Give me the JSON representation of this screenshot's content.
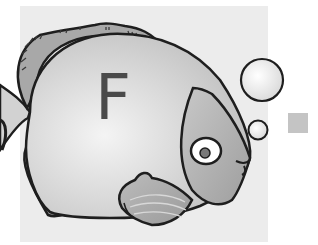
{
  "illustration": {
    "subject": "fish",
    "letter": "F",
    "colors": {
      "background_panel": "#ececec",
      "body": "#d6d6d6",
      "head": "#b8b8b8",
      "fin": "#a9a9a9",
      "outline": "#1e1e1e",
      "letter": "#4a4a4a",
      "side_square": "#c4c4c4"
    },
    "bubbles": 2
  }
}
